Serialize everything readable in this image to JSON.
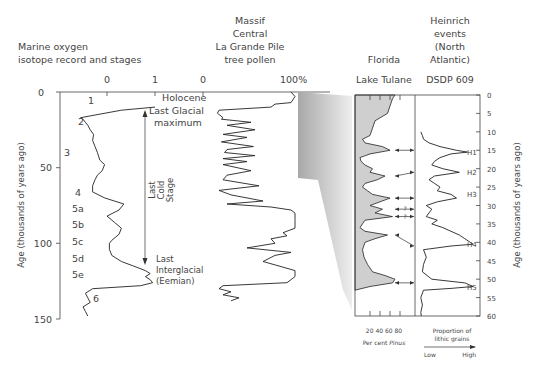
{
  "figure": {
    "isotope_panel": {
      "title_line1": "Marine oxygen",
      "title_line2": "isotope record and stages",
      "top_ticks": [
        "0",
        "1"
      ],
      "y_axis_label": "Age (thousands of years ago)",
      "y_ticks": [
        "0",
        "50",
        "100",
        "150"
      ],
      "stages": [
        "1",
        "2",
        "3",
        "4",
        "5a",
        "5b",
        "5c",
        "5d",
        "5e",
        "6"
      ],
      "annotations": {
        "holocene": "Holocene",
        "lgm_line1": "Last Glacial",
        "lgm_line2": "maximum",
        "cold_line1": "Last",
        "cold_line2": "Cold",
        "cold_line3": "Stage",
        "interglacial_line1": "Last",
        "interglacial_line2": "Interglacial",
        "interglacial_line3": "(Eemian)"
      }
    },
    "pollen_panel": {
      "title_line1": "Massif",
      "title_line2": "Central",
      "title_line3": "La Grande Pile",
      "title_line4": "tree pollen",
      "top_ticks": [
        "0",
        "100%"
      ]
    },
    "tulane_panel": {
      "title_line1": "Florida",
      "title_line2": "Lake Tulane",
      "bottom_ticks": "20 40 60 80",
      "bottom_label_prefix": "Per cent ",
      "bottom_label_italic": "Pinus"
    },
    "heinrich_panel": {
      "title_line1": "Heinrich",
      "title_line2": "events",
      "title_line3": "(North",
      "title_line4": "Atlantic)",
      "title_line5": "DSDP 609",
      "events": [
        "H1",
        "H2",
        "H3",
        "H4",
        "H5"
      ],
      "question_marks": [
        "?",
        "?"
      ],
      "bottom_label_line1": "Proportion of",
      "bottom_label_line2": "lithic grains",
      "low_label": "Low",
      "high_label": "High"
    },
    "right_axis": {
      "label": "Age (thousands of years ago)",
      "ticks": [
        "0",
        "5",
        "10",
        "15",
        "20",
        "25",
        "30",
        "35",
        "40",
        "45",
        "50",
        "55",
        "60"
      ]
    },
    "colors": {
      "fill_gray": "#cfcfcf",
      "wedge_dark": "#a8a8a8",
      "line": "#222222"
    }
  },
  "chart_data": [
    {
      "type": "line",
      "title": "Marine oxygen isotope record and stages",
      "ylabel": "Age (thousands of years ago)",
      "ylim": [
        0,
        150
      ],
      "xlim": [
        -0.8,
        1.2
      ],
      "x_ticks": [
        0,
        1
      ],
      "series": [
        {
          "name": "oxygen isotope",
          "age": [
            10,
            12,
            17,
            18,
            20,
            22,
            25,
            28,
            32,
            36,
            40,
            45,
            48,
            52,
            55,
            58,
            62,
            66,
            70,
            74,
            78,
            82,
            86,
            90,
            94,
            98,
            100,
            104,
            108,
            112,
            115,
            118,
            120,
            122,
            124,
            126,
            128,
            130,
            133,
            136,
            139,
            142,
            145,
            148
          ],
          "value": [
            1.0,
            0.3,
            -0.55,
            -0.5,
            -0.45,
            -0.4,
            -0.35,
            -0.28,
            -0.3,
            -0.25,
            -0.2,
            -0.15,
            -0.05,
            -0.1,
            -0.2,
            -0.25,
            -0.3,
            -0.3,
            -0.05,
            0.35,
            0.25,
            0.0,
            0.15,
            0.3,
            0.25,
            0.1,
            0.05,
            0.05,
            0.1,
            0.3,
            0.55,
            0.8,
            0.9,
            0.8,
            0.9,
            0.95,
            0.7,
            -0.3,
            -0.45,
            -0.4,
            -0.35,
            -0.5,
            -0.45,
            -0.4
          ]
        }
      ],
      "stage_labels": [
        {
          "label": "1",
          "age": 6
        },
        {
          "label": "2",
          "age": 20
        },
        {
          "label": "3",
          "age": 40
        },
        {
          "label": "4",
          "age": 67
        },
        {
          "label": "5a",
          "age": 77
        },
        {
          "label": "5b",
          "age": 88
        },
        {
          "label": "5c",
          "age": 99
        },
        {
          "label": "5d",
          "age": 110
        },
        {
          "label": "5e",
          "age": 121
        },
        {
          "label": "6",
          "age": 137
        }
      ]
    },
    {
      "type": "line",
      "title": "La Grande Pile tree pollen",
      "ylim": [
        0,
        150
      ],
      "xlim": [
        0,
        100
      ],
      "x_unit": "%",
      "series": [
        {
          "name": "tree pollen",
          "age": [
            0,
            3,
            7,
            8,
            10,
            12,
            14,
            17,
            18,
            20,
            22,
            25,
            28,
            30,
            33,
            36,
            38,
            40,
            42,
            44,
            46,
            48,
            52,
            55,
            58,
            62,
            65,
            68,
            72,
            74,
            76,
            78,
            80,
            85,
            90,
            93,
            95,
            97,
            100,
            103,
            106,
            108,
            112,
            115,
            118,
            122,
            126,
            128,
            130,
            132,
            134,
            136,
            138
          ],
          "value": [
            95,
            100,
            95,
            75,
            70,
            5,
            3,
            10,
            8,
            45,
            15,
            50,
            10,
            40,
            8,
            48,
            15,
            12,
            50,
            10,
            40,
            10,
            45,
            15,
            10,
            55,
            5,
            20,
            60,
            15,
            70,
            95,
            100,
            100,
            100,
            85,
            90,
            70,
            75,
            40,
            95,
            75,
            60,
            80,
            100,
            100,
            90,
            10,
            5,
            20,
            10,
            30,
            20
          ]
        }
      ]
    },
    {
      "type": "area",
      "title": "Lake Tulane, Florida",
      "xlabel": "Per cent Pinus",
      "x_ticks": [
        20,
        40,
        60,
        80
      ],
      "xlim": [
        0,
        100
      ],
      "ylim": [
        0,
        60
      ],
      "series": [
        {
          "name": "Pinus",
          "age": [
            0,
            1,
            3,
            5,
            7,
            9,
            11,
            12,
            13,
            14,
            15,
            16,
            17,
            18,
            19,
            20,
            21,
            22,
            23,
            24,
            25,
            26,
            27,
            28,
            29,
            30,
            31,
            32,
            33,
            34,
            35,
            36,
            37,
            38,
            39,
            40,
            42,
            44,
            46,
            48,
            49,
            50,
            51,
            52,
            53
          ],
          "value": [
            80,
            75,
            70,
            65,
            40,
            35,
            30,
            15,
            20,
            55,
            70,
            30,
            10,
            12,
            20,
            35,
            30,
            60,
            45,
            20,
            15,
            25,
            35,
            70,
            50,
            30,
            55,
            40,
            75,
            20,
            15,
            10,
            20,
            65,
            40,
            20,
            15,
            18,
            25,
            35,
            60,
            80,
            75,
            30,
            0
          ]
        }
      ]
    },
    {
      "type": "line",
      "title": "Heinrich events (North Atlantic) DSDP 609",
      "xlabel": "Proportion of lithic grains",
      "x_range_labels": [
        "Low",
        "High"
      ],
      "ylim": [
        0,
        60
      ],
      "series": [
        {
          "name": "lithic grains",
          "age": [
            10,
            11,
            12,
            13,
            14,
            15,
            15.5,
            16,
            17,
            18,
            19,
            20,
            21,
            22,
            23,
            24,
            25,
            26,
            27,
            28,
            29,
            30,
            31,
            32,
            33,
            34,
            35,
            36,
            37,
            38,
            39,
            40,
            40.5,
            41,
            42,
            44,
            46,
            48,
            50,
            51,
            52,
            52.5,
            53,
            55,
            57,
            59,
            60
          ],
          "value": [
            5,
            8,
            10,
            20,
            40,
            70,
            90,
            60,
            40,
            30,
            25,
            45,
            75,
            30,
            20,
            30,
            40,
            35,
            60,
            70,
            35,
            15,
            25,
            20,
            15,
            35,
            25,
            45,
            60,
            75,
            85,
            95,
            100,
            60,
            10,
            15,
            10,
            8,
            25,
            85,
            100,
            60,
            10,
            5,
            8,
            5,
            6
          ]
        }
      ],
      "events": [
        {
          "label": "H1",
          "age": 15.5
        },
        {
          "label": "H2",
          "age": 21
        },
        {
          "label": "H3",
          "age": 27
        },
        {
          "label": "H4",
          "age": 40.5
        },
        {
          "label": "H5",
          "age": 52
        }
      ],
      "correlations": [
        {
          "tulane_age": 15,
          "dsdp_age": 15,
          "certain": true
        },
        {
          "tulane_age": 22,
          "dsdp_age": 21,
          "certain": true
        },
        {
          "tulane_age": 28,
          "dsdp_age": 28,
          "certain": true
        },
        {
          "tulane_age": 31,
          "dsdp_age": 31,
          "certain": false
        },
        {
          "tulane_age": 33,
          "dsdp_age": 33,
          "certain": false
        },
        {
          "tulane_age": 38,
          "dsdp_age": 41,
          "certain": true
        },
        {
          "tulane_age": 51,
          "dsdp_age": 51,
          "certain": true
        }
      ]
    }
  ]
}
